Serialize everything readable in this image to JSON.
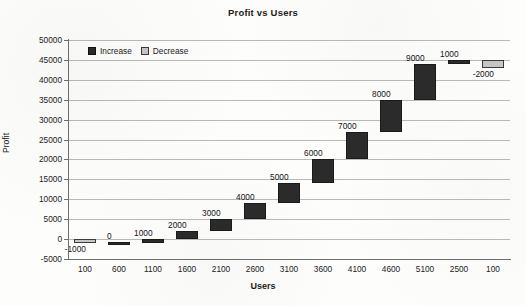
{
  "chart_data": {
    "type": "bar",
    "subtype": "waterfall",
    "title": "Profit vs Users",
    "xlabel": "Users",
    "ylabel": "Profit",
    "grid": true,
    "legend_position": "top-left",
    "ylim": [
      -5000,
      50000
    ],
    "ytick_step": 5000,
    "yticks": [
      50000,
      45000,
      40000,
      35000,
      30000,
      25000,
      20000,
      15000,
      10000,
      5000,
      0,
      -5000
    ],
    "ytick_labels": [
      "50000",
      "45000",
      "40000",
      "35000",
      "30000",
      "25000",
      "20000",
      "15000",
      "10000",
      "5000",
      "0",
      "-5000"
    ],
    "categories": [
      "100",
      "600",
      "1100",
      "1600",
      "2100",
      "2600",
      "3100",
      "3600",
      "4100",
      "4600",
      "5100",
      "2500",
      "100"
    ],
    "values": [
      -1000,
      0,
      1000,
      2000,
      3000,
      4000,
      5000,
      6000,
      7000,
      8000,
      9000,
      1000,
      -2000
    ],
    "value_labels": [
      "-1000",
      "0",
      "1000",
      "2000",
      "3000",
      "4000",
      "5000",
      "6000",
      "7000",
      "8000",
      "9000",
      "1000",
      "-2000"
    ],
    "bar_starts": [
      0,
      -1000,
      -1000,
      0,
      2000,
      5000,
      9000,
      14000,
      20000,
      27000,
      35000,
      44000,
      45000
    ],
    "bar_ends": [
      -1000,
      -1000,
      0,
      2000,
      5000,
      9000,
      14000,
      20000,
      27000,
      35000,
      44000,
      45000,
      43000
    ],
    "bar_types": [
      "decrease",
      "increase",
      "increase",
      "increase",
      "increase",
      "increase",
      "increase",
      "increase",
      "increase",
      "increase",
      "increase",
      "increase",
      "decrease"
    ],
    "label_positions": [
      "below",
      "above",
      "above",
      "above",
      "above",
      "above",
      "above",
      "above",
      "above",
      "above",
      "above",
      "above",
      "below"
    ],
    "legend": [
      {
        "label": "Increase",
        "color": "#2b2b2b"
      },
      {
        "label": "Decrease",
        "color": "#c6c6c6"
      }
    ],
    "colors": {
      "increase": "#2b2b2b",
      "decrease": "#c6c6c6",
      "grid": "#b9b9b9",
      "axis": "#6f6f6f",
      "background": "#fdfdfc",
      "text": "#1b1b1b"
    }
  }
}
